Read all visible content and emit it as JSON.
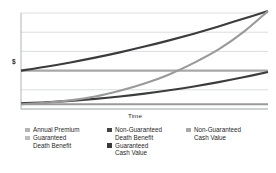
{
  "chart_data": {
    "type": "line",
    "title": "",
    "xlabel": "Time",
    "ylabel": "$",
    "xlim": [
      0,
      30
    ],
    "ylim": [
      0,
      100
    ],
    "grid": true,
    "gridlines_y": [
      0,
      20,
      40,
      60,
      80,
      100
    ],
    "x_ticks_visible": false,
    "y_ticks_visible": false,
    "legend_position": "bottom",
    "legend_columns": 3,
    "x": [
      0,
      3,
      6,
      9,
      12,
      15,
      18,
      21,
      24,
      27,
      30
    ],
    "series": [
      {
        "name": "Annual Premium",
        "color": "#9a9a9a",
        "width": 2.1,
        "values": [
          5,
          5,
          5,
          5,
          5,
          5,
          5,
          5,
          5,
          5,
          5
        ]
      },
      {
        "name": "Guaranteed Death Benefit",
        "color": "#a8a8a8",
        "width": 2.1,
        "values": [
          40,
          40,
          40,
          40,
          40,
          40,
          40,
          40,
          40,
          40,
          40
        ]
      },
      {
        "name": "Non-Guaranteed Death Benefit",
        "color": "#3c3c3c",
        "width": 2.1,
        "values": [
          40,
          44,
          48.5,
          53.5,
          59,
          65,
          71.5,
          78.5,
          86,
          94,
          102
        ]
      },
      {
        "name": "Guaranteed Cash Value",
        "color": "#3c3c3c",
        "width": 2.1,
        "values": [
          6,
          7,
          8.5,
          10.5,
          13,
          16,
          19.5,
          23.5,
          28,
          33,
          38.5
        ]
      },
      {
        "name": "Non-Guaranteed Cash Value",
        "color": "#9a9a9a",
        "width": 2.1,
        "values": [
          5,
          6.5,
          9,
          13,
          19,
          26.5,
          36,
          48,
          62,
          80,
          102
        ]
      }
    ]
  },
  "axes": {
    "y_label": "$",
    "x_label": "Time"
  },
  "legend": {
    "columns": [
      {
        "entries": [
          {
            "label": "Annual Premium",
            "color": "#b4b4b4"
          },
          {
            "label": "Guaranteed\nDeath Benefit",
            "color": "#bdbdbd"
          }
        ]
      },
      {
        "entries": [
          {
            "label": "Non-Guaranteed\nDeath Benefit",
            "color": "#444444"
          },
          {
            "label": "Guaranteed\nCash Value",
            "color": "#3a3a3a"
          }
        ]
      },
      {
        "entries": [
          {
            "label": "Non-Guaranteed\nCash Value",
            "color": "#a8a8a8"
          }
        ]
      }
    ]
  },
  "colors": {
    "background": "#ffffff",
    "grid": "#c9cfd6",
    "axis": "#9aa3ab",
    "text": "#1f1f1f"
  }
}
